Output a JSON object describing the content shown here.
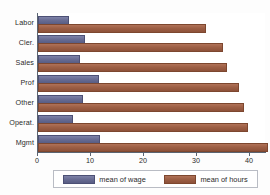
{
  "chart_data": {
    "type": "bar",
    "orientation": "horizontal",
    "title": "",
    "xlabel": "",
    "ylabel": "",
    "categories": [
      "Labor",
      "Cler.",
      "Sales",
      "Prof",
      "Other",
      "Operat.",
      "Mgmt"
    ],
    "series": [
      {
        "name": "mean of wage",
        "color": "#696d94",
        "values": [
          5.5,
          8.4,
          7.5,
          11.1,
          8.1,
          6.2,
          11.3
        ]
      },
      {
        "name": "mean of hours",
        "color": "#9d5f45",
        "values": [
          31.4,
          34.5,
          35.2,
          37.5,
          38.4,
          39.3,
          43.0
        ]
      }
    ],
    "xlim": [
      0,
      43
    ],
    "xticks": [
      0,
      10,
      20,
      30,
      40
    ],
    "xtick_labels": [
      "0",
      "10",
      "20",
      "30",
      "40"
    ],
    "grid": false,
    "legend_position": "bottom"
  },
  "legend": {
    "entries": [
      {
        "label": "mean of wage"
      },
      {
        "label": "mean of hours"
      }
    ]
  }
}
